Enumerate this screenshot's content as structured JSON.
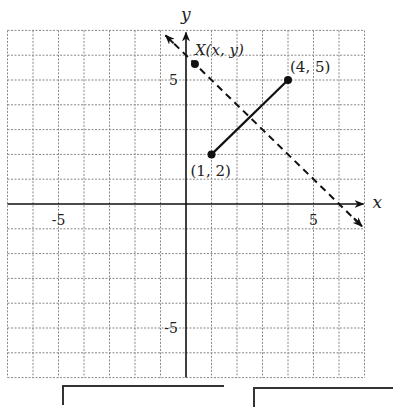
{
  "diagram": {
    "type": "coordinate-plane",
    "axes": {
      "x_label": "x",
      "y_label": "y",
      "x_range": [
        -7,
        7
      ],
      "y_range": [
        -7,
        7
      ],
      "grid": true,
      "x_ticks_labeled": [
        {
          "value": -5,
          "label": "-5"
        },
        {
          "value": 5,
          "label": "5"
        }
      ],
      "y_ticks_labeled": [
        {
          "value": 5,
          "label": "5"
        },
        {
          "value": -5,
          "label": "-5"
        }
      ]
    },
    "points": [
      {
        "name": "A",
        "x": 1,
        "y": 2,
        "label": "(1, 2)"
      },
      {
        "name": "B",
        "x": 4,
        "y": 5,
        "label": "(4, 5)"
      },
      {
        "name": "X",
        "x": 0.35,
        "y": 5.65,
        "label": "X(x, y)"
      }
    ],
    "segments": [
      {
        "from": [
          1,
          2
        ],
        "to": [
          4,
          5
        ],
        "style": "solid"
      }
    ],
    "lines": [
      {
        "equation": "y = -x + 6",
        "style": "dashed",
        "arrows": "both",
        "from": [
          -0.8,
          6.8
        ],
        "to": [
          6.9,
          -0.9
        ]
      }
    ]
  },
  "answer_boxes": [
    {
      "value": ""
    },
    {
      "value": ""
    }
  ]
}
